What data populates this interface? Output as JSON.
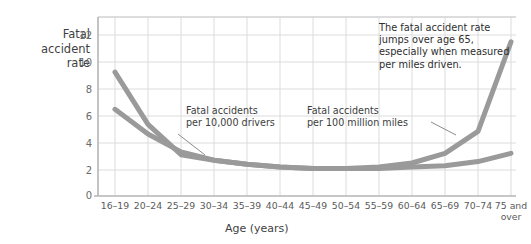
{
  "chart_data": {
    "type": "line",
    "title": "",
    "xlabel": "Age (years)",
    "ylabel": "Fatal accident rate",
    "ylim": [
      0,
      13
    ],
    "yticks": [
      0,
      2,
      4,
      6,
      8,
      10,
      12
    ],
    "grid": true,
    "legend_position": "inline-annotations",
    "categories": [
      "16–19",
      "20–24",
      "25–29",
      "30–34",
      "35–39",
      "40–44",
      "45–49",
      "50–54",
      "55–59",
      "60–64",
      "65–69",
      "70–74",
      "75 and over"
    ],
    "series": [
      {
        "name": "Fatal accidents per 100 million miles",
        "color": "#9a9a9a",
        "values": [
          9.0,
          5.2,
          3.0,
          2.6,
          2.3,
          2.1,
          2.0,
          2.0,
          2.1,
          2.4,
          3.1,
          4.7,
          11.2
        ]
      },
      {
        "name": "Fatal accidents per 10,000 drivers",
        "color": "#9a9a9a",
        "values": [
          6.3,
          4.5,
          3.2,
          2.6,
          2.3,
          2.1,
          2.0,
          2.0,
          2.0,
          2.1,
          2.2,
          2.5,
          3.1
        ]
      }
    ],
    "annotations": [
      {
        "name": "per-10000-drivers",
        "text_line1": "Fatal accidents",
        "text_line2": "per 10,000 drivers"
      },
      {
        "name": "per-100-million-miles",
        "text_line1": "Fatal accidents",
        "text_line2": "per 100 million miles"
      },
      {
        "name": "callout",
        "text": "The fatal accident rate jumps over age 65, especially when measured per miles driven."
      }
    ]
  },
  "axis": {
    "y_title_line1": "Fatal",
    "y_title_line2": "accident",
    "y_title_line3": "rate",
    "x_title": "Age (years)",
    "yticks": [
      "12",
      "10",
      "8",
      "6",
      "4",
      "2",
      "0"
    ],
    "xticks": [
      {
        "l1": "16–19",
        "l2": ""
      },
      {
        "l1": "20–24",
        "l2": ""
      },
      {
        "l1": "25–29",
        "l2": ""
      },
      {
        "l1": "30–34",
        "l2": ""
      },
      {
        "l1": "35–39",
        "l2": ""
      },
      {
        "l1": "40–44",
        "l2": ""
      },
      {
        "l1": "45–49",
        "l2": ""
      },
      {
        "l1": "50–54",
        "l2": ""
      },
      {
        "l1": "55–59",
        "l2": ""
      },
      {
        "l1": "60–64",
        "l2": ""
      },
      {
        "l1": "65–69",
        "l2": ""
      },
      {
        "l1": "70–74",
        "l2": ""
      },
      {
        "l1": "75 and",
        "l2": "over"
      }
    ]
  },
  "annotations": {
    "drivers_l1": "Fatal accidents",
    "drivers_l2": "per 10,000 drivers",
    "miles_l1": "Fatal accidents",
    "miles_l2": "per 100 million miles",
    "callout_text": "The fatal accident rate jumps over age 65, especially when measured per miles driven."
  },
  "colors": {
    "line": "#9a9a9a",
    "grid": "#dcdcdc",
    "axis": "#b5b5b5",
    "text": "#3d3d3d"
  }
}
